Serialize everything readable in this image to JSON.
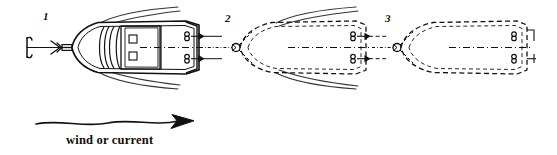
{
  "figure": {
    "type": "nautical-diagram",
    "background_color": "#ffffff",
    "ink_color": "#111111",
    "width": 557,
    "height": 155
  },
  "labels": {
    "position_1": "1",
    "position_2": "2",
    "position_3": "3"
  },
  "caption": {
    "wind_or_current": "wind or current"
  },
  "icons": {
    "anchor": "anchor-icon",
    "mooring_ball_2": "mooring-ball-icon",
    "mooring_ball_3": "mooring-ball-icon",
    "cleat": "cleat-icon",
    "arrow": "arrow-icon",
    "wind_arrow": "wind-arrow-icon"
  },
  "vessels": [
    {
      "id": "vessel-1",
      "label": "1",
      "style": "solid",
      "description": "fully drawn powerboat with cabin, windshield, deck hatches and wake spray",
      "cleats": 2,
      "cleat_arrows": true,
      "has_wake": true
    },
    {
      "id": "vessel-2",
      "label": "2",
      "style": "dashed",
      "description": "dashed outline of drifted boat position with wake spray",
      "cleats": 2,
      "cleat_arrows": true,
      "has_wake": true
    },
    {
      "id": "vessel-3",
      "label": "3",
      "style": "dashed",
      "description": "dashed outline of furthest drifted boat position",
      "cleats": 2,
      "cleat_arrows": false,
      "has_wake": false
    }
  ],
  "rode": {
    "description": "anchor rode and mooring lines running along centerline",
    "line_style": "dash-dot"
  }
}
